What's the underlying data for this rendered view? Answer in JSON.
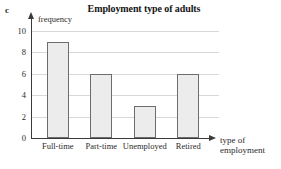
{
  "part_label": "c",
  "chart_data": {
    "type": "bar",
    "title": "Employment type of adults",
    "categories": [
      "Full-time",
      "Part-time",
      "Unemployed",
      "Retired"
    ],
    "values": [
      9,
      6,
      3,
      6
    ],
    "xlabel": "type of employment",
    "xlabel_lines": [
      "type of",
      "employment"
    ],
    "ylabel": "frequency",
    "ylim": [
      0,
      10
    ],
    "ytick_labels": [
      "0",
      "2",
      "4",
      "6",
      "8",
      "10"
    ],
    "ytick_values": [
      0,
      2,
      4,
      6,
      8,
      10
    ],
    "grid": true,
    "legend": false,
    "colors": {
      "bar_fill": "#ececec",
      "bar_border": "#6d6d6d",
      "axis": "#3a3a3a",
      "gridline": "#d8d8d8",
      "text": "#2b2b2b"
    }
  }
}
